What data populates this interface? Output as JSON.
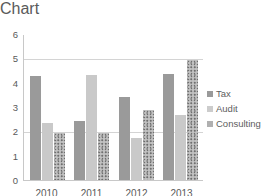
{
  "chart_data": {
    "type": "bar",
    "title": "",
    "subtitle": "",
    "xlabel": "",
    "ylabel": "",
    "categories": [
      "2010",
      "2011",
      "2012",
      "2013"
    ],
    "series": [
      {
        "name": "Tax",
        "color": "#9a9a9a",
        "pattern": "solid",
        "values": [
          4.3,
          2.45,
          3.45,
          4.4
        ]
      },
      {
        "name": "Audit",
        "color": "#c9c9c9",
        "pattern": "solid",
        "values": [
          2.35,
          4.35,
          1.75,
          2.7
        ]
      },
      {
        "name": "Consulting",
        "color": "#b4b4b4",
        "pattern": "speckled",
        "values": [
          1.95,
          1.95,
          2.9,
          4.95
        ]
      }
    ],
    "ylim": [
      0,
      6
    ],
    "ytick_labels": [
      "6",
      "5",
      "4",
      "3",
      "2",
      "1",
      "0"
    ],
    "ytick_values": [
      6,
      5,
      4,
      3,
      2,
      1,
      0
    ],
    "gridlines": [
      5,
      2
    ],
    "grid": true,
    "legend_position": "right",
    "grouping": "clustered"
  },
  "legend": {
    "items": [
      {
        "label": "Tax"
      },
      {
        "label": "Audit"
      },
      {
        "label": "Consulting"
      }
    ]
  }
}
